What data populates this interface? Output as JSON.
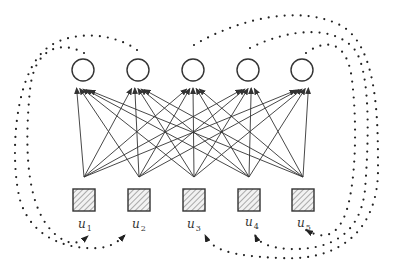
{
  "diagram": {
    "title": "",
    "colors": {
      "stroke": "#333333",
      "hatch": "#666666",
      "square_fill": "#f2f2f2",
      "dot": "#222222"
    },
    "hidden_nodes": [
      {
        "id": "h1",
        "x": 83,
        "y": 70,
        "r": 11
      },
      {
        "id": "h2",
        "x": 138,
        "y": 70,
        "r": 11
      },
      {
        "id": "h3",
        "x": 193,
        "y": 70,
        "r": 11
      },
      {
        "id": "h4",
        "x": 248,
        "y": 70,
        "r": 11
      },
      {
        "id": "h5",
        "x": 302,
        "y": 70,
        "r": 11
      }
    ],
    "input_nodes": [
      {
        "id": "u1",
        "label": "u",
        "sub": "1",
        "x": 84,
        "y": 200,
        "size": 22,
        "apex_y": 177
      },
      {
        "id": "u2",
        "label": "u",
        "sub": "2",
        "x": 139,
        "y": 200,
        "size": 22,
        "apex_y": 177
      },
      {
        "id": "u3",
        "label": "u",
        "sub": "3",
        "x": 194,
        "y": 200,
        "size": 22,
        "apex_y": 177
      },
      {
        "id": "u4",
        "label": "u",
        "sub": "4",
        "x": 249,
        "y": 200,
        "size": 22,
        "apex_y": 177
      },
      {
        "id": "u5",
        "label": "u",
        "sub": "5",
        "x": 303,
        "y": 200,
        "size": 22,
        "apex_y": 177
      }
    ],
    "connections": "fully-connected: every input node apex sends a directed arrow to every hidden node",
    "feedback_loops": [
      {
        "from": "h1",
        "to": "u1",
        "side": "left",
        "style": "dotted",
        "path": "M84,53 C60,40 34,48 30,90 C24,150 26,215 60,238 C72,246 80,243 88,236"
      },
      {
        "from": "h2",
        "to": "u2",
        "side": "left",
        "style": "dotted",
        "path": "M137,50 C110,30 60,30 40,55 C14,85 10,160 20,200 C32,240 70,250 100,248 C112,246 118,242 125,235"
      },
      {
        "from": "h3",
        "to": "u3",
        "side": "right",
        "style": "dotted",
        "path": "M194,45 C240,18 300,5 340,25 C378,45 378,120 378,170 C378,220 350,262 280,258 C230,256 212,250 205,235"
      },
      {
        "from": "h4",
        "to": "u4",
        "side": "right",
        "style": "dotted",
        "path": "M250,48 C290,28 335,25 355,50 C372,75 368,150 365,190 C360,235 330,250 290,249 C268,248 258,242 255,235"
      },
      {
        "from": "h5",
        "to": "u5",
        "side": "right",
        "style": "dotted",
        "path": "M306,53 C330,36 348,45 352,80 C358,130 355,190 345,215 C335,240 320,238 306,230"
      }
    ],
    "labels": [
      {
        "text": "u",
        "sub": "1",
        "x": 78,
        "y": 228
      },
      {
        "text": "u",
        "sub": "2",
        "x": 132,
        "y": 228
      },
      {
        "text": "u",
        "sub": "3",
        "x": 187,
        "y": 228
      },
      {
        "text": "u",
        "sub": "4",
        "x": 245,
        "y": 226
      },
      {
        "text": "u",
        "sub": "5",
        "x": 297,
        "y": 227
      }
    ]
  }
}
